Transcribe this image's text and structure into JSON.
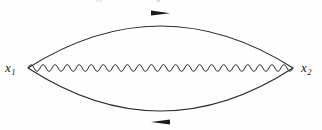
{
  "figure": {
    "type": "feynman-diagram",
    "width": 322,
    "height": 130,
    "background_color": "#fefefe",
    "line_color": "#2b2b2b"
  },
  "labels": {
    "left_vertex": {
      "symbol": "x",
      "subscript": "1"
    },
    "right_vertex": {
      "symbol": "x",
      "subscript": "2"
    },
    "top_cut_text": "p k"
  },
  "vertices": [
    {
      "name": "left-vertex",
      "x": 28,
      "y": 68
    },
    {
      "name": "right-vertex",
      "x": 293,
      "y": 68
    }
  ],
  "lines": [
    {
      "name": "top-fermion-line",
      "style": "solid-arc",
      "arrow_direction": "right",
      "arrow_x": 160,
      "apex_y": 15
    },
    {
      "name": "bottom-fermion-line",
      "style": "solid-arc",
      "arrow_direction": "left",
      "arrow_x": 160,
      "apex_y": 122
    },
    {
      "name": "photon-propagator",
      "style": "wavy",
      "cycles": 22,
      "amplitude": 5,
      "y": 68
    }
  ]
}
